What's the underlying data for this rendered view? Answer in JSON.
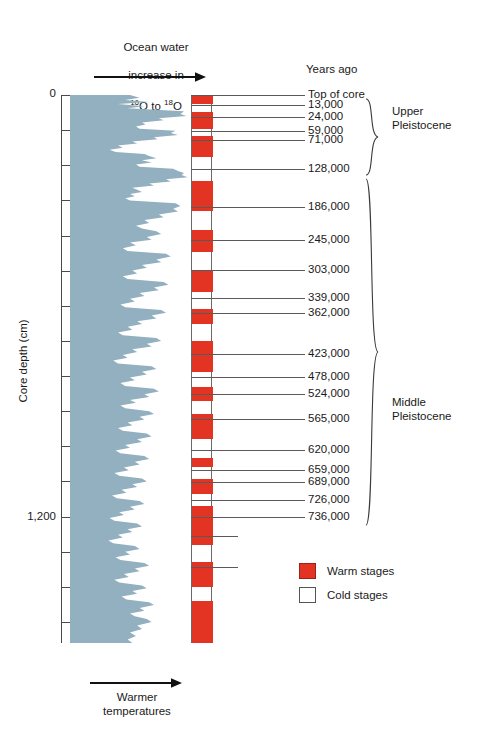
{
  "figure": {
    "top_annotation_line1": "Ocean water",
    "top_annotation_line2": "increase in",
    "top_annotation_isotope_from": "16",
    "top_annotation_isotope_from_el": "O",
    "top_annotation_isotope_joiner": " to ",
    "top_annotation_isotope_to": "18",
    "top_annotation_isotope_to_el": "O",
    "years_ago_title": "Years ago",
    "y_axis_title": "Core depth (cm)",
    "y_tick_label_top": "0",
    "y_tick_label_1200": "1,200",
    "bottom_annotation": "Warmer\ntemperatures"
  },
  "legend": {
    "items": [
      {
        "label": "Warm stages",
        "color": "#e23323",
        "swatch": "filled"
      },
      {
        "label": "Cold stages",
        "color": "#ffffff",
        "swatch": "outline"
      }
    ]
  },
  "epochs": [
    {
      "name": "Upper\nPleistocene",
      "from_year": 13000,
      "to_year": 128000
    },
    {
      "name": "Middle\nPleistocene",
      "from_year": 128000,
      "to_year": 736000
    }
  ],
  "chart_data": {
    "type": "area",
    "xlabel": "Ocean water increase in 16O to 18O  /  Warmer temperatures",
    "ylabel": "Core depth (cm)",
    "ylim": [
      0,
      1560
    ],
    "y_ticks": [
      0,
      100,
      200,
      300,
      400,
      500,
      600,
      700,
      800,
      900,
      1000,
      1100,
      1200,
      1300,
      1400,
      1500
    ],
    "y_tick_labels_shown": [
      "0",
      "",
      "",
      "",
      "",
      "",
      "",
      "",
      "",
      "",
      "",
      "",
      "1,200",
      "",
      "",
      ""
    ],
    "grid": false,
    "legend_position": "right-lower",
    "age_markers": [
      {
        "label": "Top of core",
        "years": 0,
        "depth_cm": 0
      },
      {
        "label": "13,000",
        "years": 13000,
        "depth_cm": 28
      },
      {
        "label": "24,000",
        "years": 24000,
        "depth_cm": 62
      },
      {
        "label": "59,000",
        "years": 59000,
        "depth_cm": 102
      },
      {
        "label": "71,000",
        "years": 71000,
        "depth_cm": 128
      },
      {
        "label": "128,000",
        "years": 128000,
        "depth_cm": 210
      },
      {
        "label": "186,000",
        "years": 186000,
        "depth_cm": 318
      },
      {
        "label": "245,000",
        "years": 245000,
        "depth_cm": 412
      },
      {
        "label": "303,000",
        "years": 303000,
        "depth_cm": 497
      },
      {
        "label": "339,000",
        "years": 339000,
        "depth_cm": 579
      },
      {
        "label": "362,000",
        "years": 362000,
        "depth_cm": 622
      },
      {
        "label": "423,000",
        "years": 423000,
        "depth_cm": 738
      },
      {
        "label": "478,000",
        "years": 478000,
        "depth_cm": 804
      },
      {
        "label": "524,000",
        "years": 524000,
        "depth_cm": 852
      },
      {
        "label": "565,000",
        "years": 565000,
        "depth_cm": 923
      },
      {
        "label": "620,000",
        "years": 620000,
        "depth_cm": 1011
      },
      {
        "label": "659,000",
        "years": 659000,
        "depth_cm": 1068
      },
      {
        "label": "689,000",
        "years": 689000,
        "depth_cm": 1102
      },
      {
        "label": "726,000",
        "years": 726000,
        "depth_cm": 1153
      },
      {
        "label": "736,000",
        "years": 736000,
        "depth_cm": 1200
      }
    ],
    "warm_stage_bands_depth_cm": [
      [
        0,
        26
      ],
      [
        48,
        96
      ],
      [
        116,
        176
      ],
      [
        244,
        330
      ],
      [
        384,
        446
      ],
      [
        498,
        562
      ],
      [
        610,
        652
      ],
      [
        700,
        790
      ],
      [
        832,
        872
      ],
      [
        908,
        980
      ],
      [
        1032,
        1060
      ],
      [
        1092,
        1136
      ],
      [
        1170,
        1280
      ],
      [
        1330,
        1400
      ],
      [
        1440,
        1560
      ]
    ],
    "isotope_curve_depth_value": [
      [
        0,
        0.5
      ],
      [
        8,
        0.58
      ],
      [
        14,
        0.46
      ],
      [
        20,
        0.66
      ],
      [
        26,
        0.4
      ],
      [
        32,
        0.62
      ],
      [
        38,
        0.48
      ],
      [
        46,
        0.95
      ],
      [
        54,
        0.92
      ],
      [
        60,
        0.97
      ],
      [
        66,
        0.74
      ],
      [
        72,
        0.78
      ],
      [
        78,
        0.6
      ],
      [
        84,
        0.63
      ],
      [
        90,
        0.55
      ],
      [
        96,
        0.58
      ],
      [
        102,
        0.88
      ],
      [
        108,
        0.84
      ],
      [
        114,
        0.9
      ],
      [
        120,
        0.7
      ],
      [
        126,
        0.73
      ],
      [
        132,
        0.52
      ],
      [
        138,
        0.56
      ],
      [
        144,
        0.4
      ],
      [
        150,
        0.44
      ],
      [
        156,
        0.33
      ],
      [
        162,
        0.38
      ],
      [
        168,
        0.62
      ],
      [
        174,
        0.66
      ],
      [
        180,
        0.72
      ],
      [
        186,
        0.6
      ],
      [
        192,
        0.68
      ],
      [
        198,
        0.55
      ],
      [
        204,
        0.58
      ],
      [
        210,
        0.86
      ],
      [
        216,
        0.9
      ],
      [
        222,
        0.95
      ],
      [
        228,
        0.93
      ],
      [
        234,
        0.98
      ],
      [
        240,
        0.8
      ],
      [
        246,
        0.84
      ],
      [
        252,
        0.66
      ],
      [
        258,
        0.7
      ],
      [
        264,
        0.52
      ],
      [
        270,
        0.56
      ],
      [
        276,
        0.6
      ],
      [
        282,
        0.5
      ],
      [
        288,
        0.54
      ],
      [
        294,
        0.46
      ],
      [
        300,
        0.5
      ],
      [
        308,
        0.88
      ],
      [
        316,
        0.92
      ],
      [
        324,
        0.86
      ],
      [
        332,
        0.9
      ],
      [
        340,
        0.74
      ],
      [
        348,
        0.78
      ],
      [
        356,
        0.62
      ],
      [
        364,
        0.66
      ],
      [
        372,
        0.55
      ],
      [
        380,
        0.6
      ],
      [
        388,
        0.72
      ],
      [
        396,
        0.76
      ],
      [
        404,
        0.64
      ],
      [
        412,
        0.68
      ],
      [
        420,
        0.5
      ],
      [
        428,
        0.55
      ],
      [
        436,
        0.44
      ],
      [
        444,
        0.48
      ],
      [
        452,
        0.8
      ],
      [
        460,
        0.84
      ],
      [
        468,
        0.72
      ],
      [
        476,
        0.76
      ],
      [
        484,
        0.6
      ],
      [
        492,
        0.64
      ],
      [
        500,
        0.52
      ],
      [
        508,
        0.56
      ],
      [
        516,
        0.44
      ],
      [
        524,
        0.48
      ],
      [
        532,
        0.78
      ],
      [
        540,
        0.82
      ],
      [
        548,
        0.7
      ],
      [
        556,
        0.74
      ],
      [
        564,
        0.58
      ],
      [
        572,
        0.62
      ],
      [
        580,
        0.5
      ],
      [
        588,
        0.54
      ],
      [
        596,
        0.42
      ],
      [
        604,
        0.46
      ],
      [
        612,
        0.76
      ],
      [
        620,
        0.8
      ],
      [
        628,
        0.68
      ],
      [
        636,
        0.72
      ],
      [
        644,
        0.56
      ],
      [
        652,
        0.6
      ],
      [
        660,
        0.48
      ],
      [
        668,
        0.52
      ],
      [
        676,
        0.4
      ],
      [
        684,
        0.44
      ],
      [
        692,
        0.72
      ],
      [
        700,
        0.76
      ],
      [
        708,
        0.64
      ],
      [
        716,
        0.68
      ],
      [
        724,
        0.52
      ],
      [
        732,
        0.56
      ],
      [
        740,
        0.44
      ],
      [
        748,
        0.48
      ],
      [
        756,
        0.36
      ],
      [
        764,
        0.4
      ],
      [
        772,
        0.68
      ],
      [
        780,
        0.72
      ],
      [
        788,
        0.6
      ],
      [
        796,
        0.64
      ],
      [
        804,
        0.5
      ],
      [
        812,
        0.54
      ],
      [
        820,
        0.42
      ],
      [
        828,
        0.46
      ],
      [
        836,
        0.7
      ],
      [
        844,
        0.74
      ],
      [
        852,
        0.62
      ],
      [
        860,
        0.66
      ],
      [
        868,
        0.5
      ],
      [
        876,
        0.55
      ],
      [
        884,
        0.42
      ],
      [
        892,
        0.46
      ],
      [
        900,
        0.66
      ],
      [
        908,
        0.7
      ],
      [
        916,
        0.58
      ],
      [
        924,
        0.62
      ],
      [
        932,
        0.48
      ],
      [
        940,
        0.52
      ],
      [
        948,
        0.4
      ],
      [
        956,
        0.44
      ],
      [
        964,
        0.64
      ],
      [
        972,
        0.68
      ],
      [
        980,
        0.56
      ],
      [
        988,
        0.6
      ],
      [
        996,
        0.46
      ],
      [
        1004,
        0.5
      ],
      [
        1012,
        0.38
      ],
      [
        1020,
        0.42
      ],
      [
        1028,
        0.62
      ],
      [
        1036,
        0.66
      ],
      [
        1044,
        0.54
      ],
      [
        1052,
        0.58
      ],
      [
        1060,
        0.45
      ],
      [
        1068,
        0.49
      ],
      [
        1076,
        0.37
      ],
      [
        1084,
        0.41
      ],
      [
        1092,
        0.6
      ],
      [
        1100,
        0.64
      ],
      [
        1108,
        0.52
      ],
      [
        1116,
        0.56
      ],
      [
        1124,
        0.43
      ],
      [
        1132,
        0.47
      ],
      [
        1140,
        0.35
      ],
      [
        1148,
        0.39
      ],
      [
        1156,
        0.58
      ],
      [
        1164,
        0.62
      ],
      [
        1172,
        0.5
      ],
      [
        1180,
        0.54
      ],
      [
        1188,
        0.41
      ],
      [
        1196,
        0.45
      ],
      [
        1204,
        0.33
      ],
      [
        1212,
        0.37
      ],
      [
        1220,
        0.56
      ],
      [
        1228,
        0.6
      ],
      [
        1236,
        0.48
      ],
      [
        1244,
        0.52
      ],
      [
        1252,
        0.4
      ],
      [
        1260,
        0.44
      ],
      [
        1268,
        0.32
      ],
      [
        1276,
        0.36
      ],
      [
        1284,
        0.54
      ],
      [
        1292,
        0.58
      ],
      [
        1300,
        0.46
      ],
      [
        1308,
        0.5
      ],
      [
        1316,
        0.38
      ],
      [
        1324,
        0.42
      ],
      [
        1332,
        0.62
      ],
      [
        1340,
        0.66
      ],
      [
        1348,
        0.54
      ],
      [
        1356,
        0.58
      ],
      [
        1364,
        0.45
      ],
      [
        1372,
        0.49
      ],
      [
        1380,
        0.37
      ],
      [
        1388,
        0.41
      ],
      [
        1396,
        0.6
      ],
      [
        1404,
        0.64
      ],
      [
        1412,
        0.52
      ],
      [
        1420,
        0.56
      ],
      [
        1428,
        0.43
      ],
      [
        1436,
        0.47
      ],
      [
        1444,
        0.66
      ],
      [
        1452,
        0.7
      ],
      [
        1460,
        0.58
      ],
      [
        1468,
        0.62
      ],
      [
        1476,
        0.5
      ],
      [
        1484,
        0.54
      ],
      [
        1492,
        0.64
      ],
      [
        1500,
        0.68
      ],
      [
        1510,
        0.56
      ],
      [
        1520,
        0.6
      ],
      [
        1530,
        0.5
      ],
      [
        1540,
        0.55
      ],
      [
        1550,
        0.48
      ],
      [
        1560,
        0.52
      ]
    ]
  }
}
